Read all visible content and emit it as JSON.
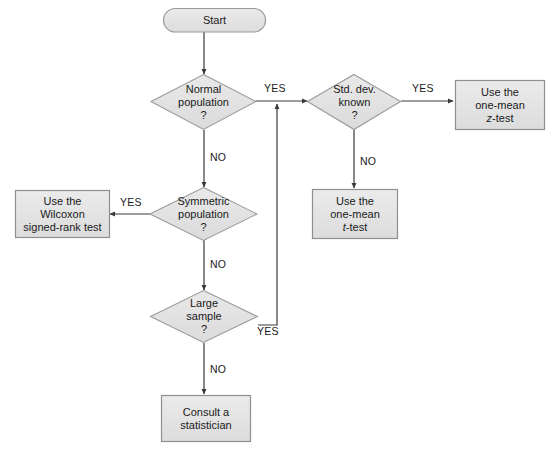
{
  "diagram": {
    "background_color": "#ffffff",
    "node_fill_color": "#e3e3e3",
    "node_border_color": "#8f8f8f",
    "connector_color": "#3a3a3a",
    "text_color": "#1a1a1a"
  },
  "nodes": {
    "start": {
      "label": "Start",
      "shape": "terminator"
    },
    "normal_population": {
      "label": "Normal\npopulation\n?",
      "shape": "decision"
    },
    "std_dev_known": {
      "label": "Std. dev.\nknown\n?",
      "shape": "decision"
    },
    "z_test": {
      "line1": "Use the",
      "line2": "one-mean",
      "line3_italic": "z",
      "line3_rest": "-test",
      "shape": "process"
    },
    "t_test": {
      "line1": "Use the",
      "line2": "one-mean",
      "line3_italic": "t",
      "line3_rest": "-test",
      "shape": "process"
    },
    "symmetric_population": {
      "label": "Symmetric\npopulation\n?",
      "shape": "decision"
    },
    "wilcoxon": {
      "label": "Use the\nWilcoxon\nsigned-rank test",
      "shape": "process"
    },
    "large_sample": {
      "label": "Large\nsample\n?",
      "shape": "decision"
    },
    "consult": {
      "label": "Consult a\nstatistician",
      "shape": "process"
    }
  },
  "edge_labels": {
    "normal_yes": "YES",
    "normal_no": "NO",
    "stddev_yes": "YES",
    "stddev_no": "NO",
    "symmetric_yes": "YES",
    "symmetric_no": "NO",
    "large_yes": "YES",
    "large_no": "NO"
  }
}
